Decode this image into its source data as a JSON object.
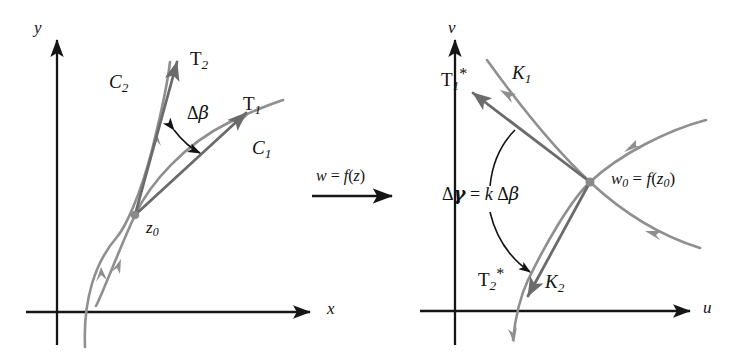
{
  "figure": {
    "colors": {
      "axis": "#151515",
      "curve": "#8f8f8f",
      "tangent": "#6b6b6b",
      "arc": "#141414",
      "point": "#8a8a8a",
      "text": "#121212",
      "background": "#ffffff"
    }
  },
  "left_panel": {
    "name": "z-plane",
    "axes": {
      "x_label": "x",
      "y_label": "y"
    },
    "point": {
      "base": "z",
      "subscript": "0",
      "label": "z0"
    },
    "curves": [
      {
        "name": "C1",
        "base": "C",
        "subscript": "1"
      },
      {
        "name": "C2",
        "base": "C",
        "subscript": "2"
      }
    ],
    "tangents": [
      {
        "name": "T1",
        "base": "T",
        "subscript": "1"
      },
      {
        "name": "T2",
        "base": "T",
        "subscript": "2"
      }
    ],
    "angle": {
      "symbol": "Δβ",
      "delta": "Δ",
      "greek": "β"
    }
  },
  "map_arrow": {
    "label": "w = f(z)",
    "w": "w",
    "equals": "=",
    "f": "f",
    "open": "(",
    "arg": "z",
    "close": ")"
  },
  "right_panel": {
    "name": "w-plane",
    "axes": {
      "x_label": "u",
      "y_label": "v"
    },
    "point": {
      "label": "w0 = f(z0)",
      "w": "w",
      "w_sub": "0",
      "equals": "=",
      "f": "f",
      "open": "(",
      "arg": "z",
      "arg_sub": "0",
      "close": ")"
    },
    "curves": [
      {
        "name": "K1",
        "base": "K",
        "subscript": "1"
      },
      {
        "name": "K2",
        "base": "K",
        "subscript": "2"
      }
    ],
    "tangents": [
      {
        "name": "T1*",
        "base": "T",
        "subscript": "1",
        "star": "*"
      },
      {
        "name": "T2*",
        "base": "T",
        "subscript": "2",
        "star": "*"
      }
    ],
    "angle": {
      "label": "Δγ = k Δβ",
      "delta1": "Δ",
      "gamma": "γ",
      "equals": "=",
      "k": "k",
      "delta2": "Δ",
      "beta": "β"
    }
  }
}
